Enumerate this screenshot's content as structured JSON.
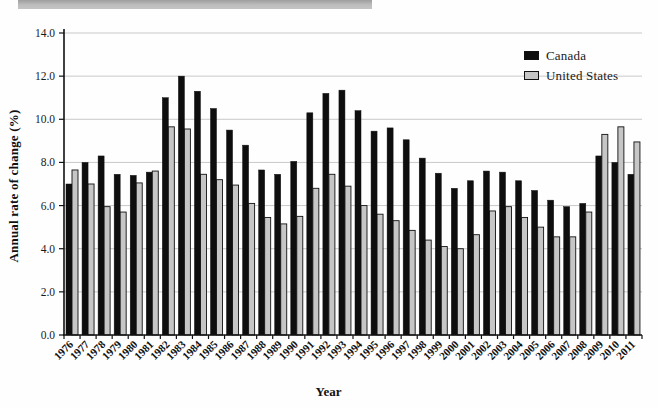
{
  "top_strip": {
    "color": "#b3b3b3"
  },
  "chart_data": {
    "type": "bar",
    "title": "",
    "xlabel": "Year",
    "ylabel": "Annual rate of change (%)",
    "ylim": [
      0,
      14
    ],
    "ytick_step": 2,
    "ytick_labels": [
      "0.0",
      "2.0",
      "4.0",
      "6.0",
      "8.0",
      "10.0",
      "12.0",
      "14.0"
    ],
    "grid": true,
    "legend_position": "top-right",
    "categories": [
      "1976",
      "1977",
      "1978",
      "1979",
      "1980",
      "1981",
      "1982",
      "1983",
      "1984",
      "1985",
      "1986",
      "1987",
      "1988",
      "1989",
      "1990",
      "1991",
      "1992",
      "1993",
      "1994",
      "1995",
      "1996",
      "1997",
      "1998",
      "1999",
      "2000",
      "2001",
      "2002",
      "2003",
      "2004",
      "2005",
      "2006",
      "2007",
      "2008",
      "2009",
      "2010",
      "2011"
    ],
    "series": [
      {
        "name": "Canada",
        "color": "#0e0e0e",
        "values": [
          7.0,
          8.0,
          8.3,
          7.45,
          7.4,
          7.55,
          11.0,
          12.0,
          11.3,
          10.5,
          9.5,
          8.8,
          7.65,
          7.45,
          8.05,
          10.3,
          11.2,
          11.35,
          10.4,
          9.45,
          9.6,
          9.05,
          8.2,
          7.5,
          6.8,
          7.15,
          7.6,
          7.55,
          7.15,
          6.7,
          6.25,
          5.95,
          6.1,
          8.3,
          8.0,
          7.45
        ]
      },
      {
        "name": "United States",
        "color": "#c6c6c6",
        "values": [
          7.65,
          7.0,
          5.95,
          5.7,
          7.05,
          7.6,
          9.65,
          9.55,
          7.45,
          7.2,
          6.95,
          6.1,
          5.45,
          5.15,
          5.5,
          6.8,
          7.45,
          6.9,
          6.0,
          5.6,
          5.3,
          4.85,
          4.4,
          4.1,
          4.0,
          4.65,
          5.75,
          5.95,
          5.45,
          5.0,
          4.55,
          4.55,
          5.7,
          9.3,
          9.65,
          8.95
        ]
      }
    ]
  }
}
